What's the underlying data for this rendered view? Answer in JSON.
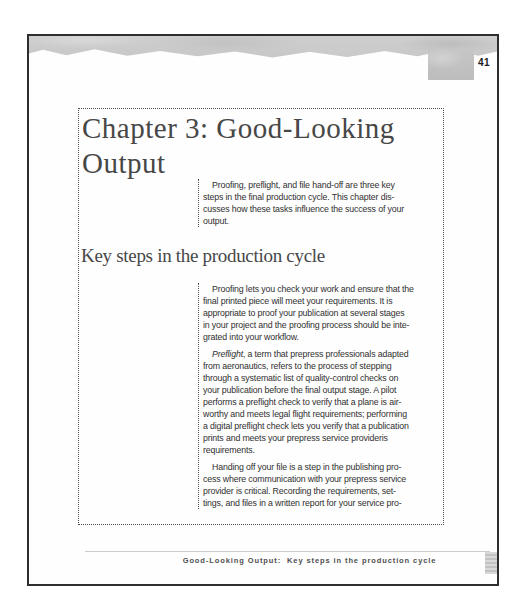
{
  "page": {
    "number": "41"
  },
  "article": {
    "chapter_title": "Chapter 3: Good-Looking\nOutput",
    "intro": "Proofing, preflight, and file hand-off are three key\nsteps in the final production cycle. This chapter dis-\ncusses how these tasks influence the success of your\noutput.",
    "section_heading": "Key steps in the production cycle",
    "para_proofing": "Proofing lets you check your work and ensure that the\nfinal printed piece will meet your requirements. It is\nappropriate to proof your publication at several stages\nin your project and the proofing process should be inte-\ngrated into your workflow.",
    "para_preflight": {
      "lead": "Preflight",
      "rest": ", a term that prepress professionals adapted\nfrom aeronautics, refers to the process of stepping\nthrough a systematic list of quality-control checks on\nyour publication before the final output stage. A pilot\nperforms a preflight check to verify that a plane is air-\nworthy and meets legal flight requirements; performing\na digital preflight check lets you verify that a publication\nprints and meets your prepress service provideris\nrequirements."
    },
    "para_handoff": "Handing off your file is a step in the publishing pro-\ncess where communication with your prepress service\nprovider is critical. Recording the requirements, set-\ntings, and files in a written report for your service pro-"
  },
  "footer": {
    "text": "Good-Looking Output:  Key steps in the production cycle"
  },
  "colors": {
    "paper": "#fefefe",
    "page_border": "#2e2e2e",
    "band_gray": "#c9c9c9",
    "body_text": "#303030",
    "heading_text": "#474747",
    "footer_rule": "#cccccc"
  }
}
